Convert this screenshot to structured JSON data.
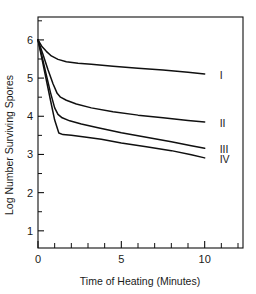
{
  "chart_data": {
    "type": "line",
    "title": "",
    "xlabel": "Time of Heating (Minutes)",
    "ylabel": "Log Number Surviving Spores",
    "xlim": [
      0,
      12.3
    ],
    "ylim": [
      0.55,
      6.6
    ],
    "xticks": [
      0,
      5,
      10
    ],
    "xtick_labels": [
      "0",
      "5",
      "10"
    ],
    "xminor_ticks": [
      1,
      2,
      3,
      4,
      6,
      7,
      8,
      9,
      11,
      12
    ],
    "yticks": [
      1,
      2,
      3,
      4,
      5,
      6
    ],
    "ytick_labels": [
      "1",
      "2",
      "3",
      "4",
      "5",
      "6"
    ],
    "yminor_ticks": [
      1.5,
      2.5,
      3.5,
      4.5,
      5.5,
      6.5
    ],
    "grid": false,
    "legend_position": "right-inline",
    "frame": "box",
    "line_color": "#101010",
    "background_color": "#ffffff",
    "series": [
      {
        "name": "I",
        "label": "I",
        "label_x": 10.9,
        "label_y": 5.08,
        "points": [
          [
            0.0,
            6.0
          ],
          [
            0.25,
            5.82
          ],
          [
            0.5,
            5.7
          ],
          [
            0.8,
            5.58
          ],
          [
            1.2,
            5.49
          ],
          [
            1.7,
            5.43
          ],
          [
            2.4,
            5.39
          ],
          [
            3.2,
            5.36
          ],
          [
            4.5,
            5.31
          ],
          [
            6.0,
            5.26
          ],
          [
            7.5,
            5.21
          ],
          [
            9.0,
            5.15
          ],
          [
            10.0,
            5.11
          ]
        ]
      },
      {
        "name": "II",
        "label": "II",
        "label_x": 10.9,
        "label_y": 3.83,
        "points": [
          [
            0.0,
            6.0
          ],
          [
            0.3,
            5.62
          ],
          [
            0.6,
            5.22
          ],
          [
            0.9,
            4.85
          ],
          [
            1.15,
            4.6
          ],
          [
            1.35,
            4.5
          ],
          [
            1.7,
            4.42
          ],
          [
            2.3,
            4.32
          ],
          [
            3.2,
            4.22
          ],
          [
            4.5,
            4.12
          ],
          [
            6.0,
            4.03
          ],
          [
            7.5,
            3.96
          ],
          [
            9.0,
            3.89
          ],
          [
            10.0,
            3.85
          ]
        ]
      },
      {
        "name": "III",
        "label": "III",
        "label_x": 10.9,
        "label_y": 3.14,
        "points": [
          [
            0.0,
            6.0
          ],
          [
            0.25,
            5.55
          ],
          [
            0.5,
            5.08
          ],
          [
            0.75,
            4.62
          ],
          [
            1.0,
            4.22
          ],
          [
            1.2,
            4.05
          ],
          [
            1.45,
            3.96
          ],
          [
            1.9,
            3.88
          ],
          [
            2.6,
            3.8
          ],
          [
            3.6,
            3.7
          ],
          [
            5.0,
            3.57
          ],
          [
            6.5,
            3.45
          ],
          [
            8.0,
            3.33
          ],
          [
            9.2,
            3.23
          ],
          [
            10.0,
            3.16
          ]
        ]
      },
      {
        "name": "IV",
        "label": "IV",
        "label_x": 10.9,
        "label_y": 2.88,
        "points": [
          [
            0.0,
            6.0
          ],
          [
            0.25,
            5.48
          ],
          [
            0.5,
            4.95
          ],
          [
            0.75,
            4.42
          ],
          [
            1.0,
            3.9
          ],
          [
            1.25,
            3.56
          ],
          [
            1.5,
            3.52
          ],
          [
            2.0,
            3.5
          ],
          [
            2.8,
            3.46
          ],
          [
            3.8,
            3.4
          ],
          [
            5.0,
            3.3
          ],
          [
            6.5,
            3.2
          ],
          [
            8.0,
            3.1
          ],
          [
            9.2,
            2.99
          ],
          [
            10.0,
            2.91
          ]
        ]
      }
    ]
  }
}
